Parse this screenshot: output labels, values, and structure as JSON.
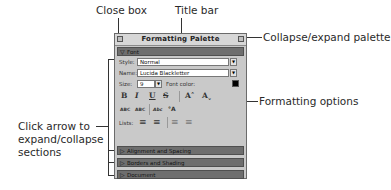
{
  "callouts": {
    "close_box": "Close box",
    "title_bar": "Title bar",
    "collapse_expand": "Collapse/expand palette",
    "formatting_options": "Formatting options",
    "click_arrow_line1": "Click arrow to",
    "click_arrow_line2": "expand/collapse",
    "click_arrow_line3": "sections"
  },
  "palette": {
    "title": "Formatting Palette",
    "font_section": {
      "label": "Font",
      "style_label": "Style:",
      "style_value": "Normal",
      "name_label": "Name:",
      "name_value": "Lucida Blackletter",
      "size_label": "Size:",
      "size_value": "9",
      "font_color_label": "Font color:",
      "font_color": "#000000",
      "buttons": [
        "B",
        "I",
        "U",
        "S",
        "A˄",
        "Aˬ"
      ],
      "effects": [
        "ABC",
        "ABC",
        "Abc",
        "°A"
      ],
      "lists_label": "Lists:"
    },
    "sections": [
      {
        "label": "Alignment and Spacing"
      },
      {
        "label": "Borders and Shading"
      },
      {
        "label": "Document"
      }
    ]
  },
  "colors": {
    "palette_bg": "#c9c9c9",
    "section_header": "#6e6e6e"
  }
}
